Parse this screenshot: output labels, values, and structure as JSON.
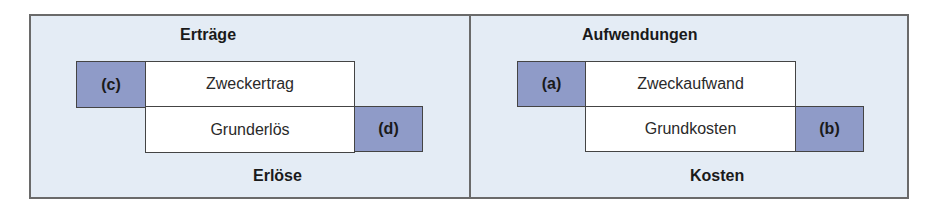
{
  "left_panel": {
    "top_label": "Erträge",
    "bottom_label": "Erlöse",
    "overlap_top": "Zweckertrag",
    "overlap_bottom": "Grunderlös",
    "marker_left": "(c)",
    "marker_right": "(d)"
  },
  "right_panel": {
    "top_label": "Aufwendungen",
    "bottom_label": "Kosten",
    "overlap_top": "Zweckaufwand",
    "overlap_bottom": "Grundkosten",
    "marker_left": "(a)",
    "marker_right": "(b)"
  },
  "colors": {
    "panel_background": "#e4ecf5",
    "marker_fill": "#8f9bc8",
    "box_fill": "#ffffff",
    "border": "#444444"
  }
}
